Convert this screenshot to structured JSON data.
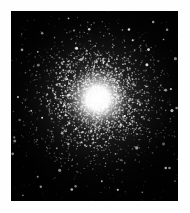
{
  "page": {
    "width": 190,
    "height": 213,
    "background_color": "#fefefe",
    "margin_color": "#ffffff"
  },
  "figure": {
    "kind": "astronomical-photograph",
    "caption": "",
    "label": "",
    "frame": {
      "left": 11,
      "top": 11,
      "width": 167,
      "height": 190,
      "background_color": "#000000",
      "border_color": "#000000"
    }
  },
  "image_data": {
    "type": "starfield",
    "sky_background_color": "#020202",
    "core_color": "#ffffff",
    "halo_color": "#d8d8d8",
    "star_color": "#ffffff",
    "core": {
      "center_x": 0.52,
      "center_y": 0.46,
      "saturated_radius": 0.085,
      "bright_radius": 0.17,
      "halo_radius": 0.34,
      "outer_radius": 0.62
    },
    "star_counts": {
      "core_halo": 1500,
      "mid_field": 900,
      "outer_field": 450,
      "bright_foreground": 60
    },
    "density_falloff": 2.1,
    "seed": 20240517,
    "vignette_strength": 0.55,
    "grain_opacity": 0.18
  }
}
